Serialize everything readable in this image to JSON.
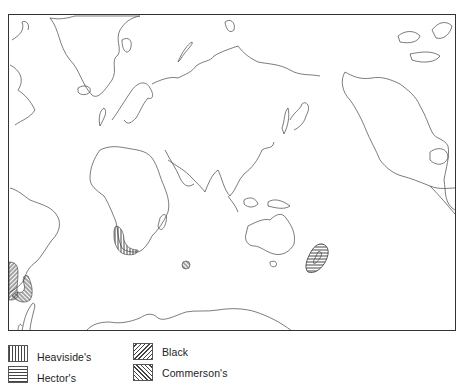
{
  "map": {
    "type": "world distribution map",
    "projection": "Pacific-centered world outline",
    "frame": {
      "x": 8,
      "y": 14,
      "width": 448,
      "height": 317
    },
    "ranges": [
      {
        "species": "Heaviside's",
        "region": "south-west coast of Africa",
        "pattern": "vertical"
      },
      {
        "species": "Black",
        "region": "coast of Chile (western South America)",
        "pattern": "diagonal-right"
      },
      {
        "species": "Commerson's",
        "region": "Tierra del Fuego / southern Argentina",
        "pattern": "diagonal-left"
      },
      {
        "species": "Commerson's",
        "region": "Kerguelen Islands (southern Indian Ocean)",
        "pattern": "diagonal-left"
      },
      {
        "species": "Hector's",
        "region": "New Zealand",
        "pattern": "horizontal"
      }
    ]
  },
  "legend": {
    "items": [
      {
        "label": "Heaviside's",
        "pattern": "vertical"
      },
      {
        "label": "Hector's",
        "pattern": "horizontal"
      },
      {
        "label": "Black",
        "pattern": "diagonal-right"
      },
      {
        "label": "Commerson's",
        "pattern": "diagonal-left"
      }
    ]
  },
  "colors": {
    "outline": "#444444",
    "hatch": "#333333",
    "background": "#ffffff"
  }
}
